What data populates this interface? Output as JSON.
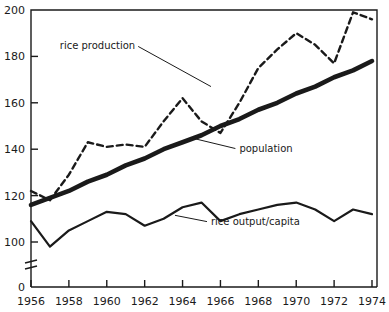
{
  "chart_data": {
    "type": "line",
    "title": "",
    "subtitle": "",
    "xlabel": "",
    "ylabel": "",
    "xlim": [
      1956,
      1974
    ],
    "ylim": [
      0,
      200
    ],
    "y_axis_break": true,
    "y_axis_break_note": "axis broken between 0 and ~95",
    "grid": false,
    "legend_position": "inline-annotations",
    "x": [
      1956,
      1957,
      1958,
      1959,
      1960,
      1961,
      1962,
      1963,
      1964,
      1965,
      1966,
      1967,
      1968,
      1969,
      1970,
      1971,
      1972,
      1973,
      1974
    ],
    "yticks": [
      0,
      100,
      120,
      140,
      160,
      180,
      200
    ],
    "ytick_labels": [
      "0",
      "100",
      "120",
      "140",
      "160",
      "180",
      "200"
    ],
    "xticks": [
      1956,
      1958,
      1960,
      1962,
      1964,
      1966,
      1968,
      1970,
      1972,
      1974
    ],
    "xtick_labels": [
      "1956",
      "1958",
      "1960",
      "1962",
      "1964",
      "1966",
      "1968",
      "1970",
      "1972",
      "1974"
    ],
    "series": [
      {
        "name": "rice production",
        "style": "dashed",
        "values": [
          122,
          118,
          129,
          143,
          141,
          142,
          141,
          152,
          162,
          152,
          147,
          160,
          175,
          183,
          190,
          185,
          177,
          199,
          196
        ]
      },
      {
        "name": "population",
        "style": "thick-solid",
        "values": [
          116,
          119,
          122,
          126,
          129,
          133,
          136,
          140,
          143,
          146,
          150,
          153,
          157,
          160,
          164,
          167,
          171,
          174,
          178
        ]
      },
      {
        "name": "rice output/capita",
        "style": "solid",
        "values": [
          109,
          98,
          105,
          109,
          113,
          112,
          107,
          110,
          115,
          117,
          109,
          112,
          114,
          116,
          117,
          114,
          109,
          114,
          112
        ]
      }
    ],
    "annotations": [
      {
        "text": "rice production",
        "x": 1961.5,
        "y": 183,
        "leader_to": {
          "x": 1965.5,
          "y": 167
        }
      },
      {
        "text": "population",
        "x": 1967.0,
        "y": 139,
        "leader_to": {
          "x": 1964.4,
          "y": 145
        }
      },
      {
        "text": "rice output/capita",
        "x": 1965.5,
        "y": 107.5,
        "leader_to": {
          "x": 1963.6,
          "y": 111.5
        }
      }
    ],
    "colors": {
      "axis": "#1a1a1a",
      "rice_production": "#1a1a1a",
      "population": "#1a1a1a",
      "rice_output_per_capita": "#1a1a1a",
      "background": "#ffffff"
    }
  }
}
